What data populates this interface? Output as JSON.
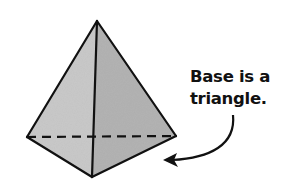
{
  "diagram": {
    "colors": {
      "left_face": "#c9c9c9",
      "right_face": "#b3b3b3",
      "bottom_face": "#bdbdbd",
      "edge": "#111111"
    },
    "annotation": {
      "lines": [
        "Base is a",
        "triangle."
      ],
      "arrow_points_to": "base"
    }
  }
}
